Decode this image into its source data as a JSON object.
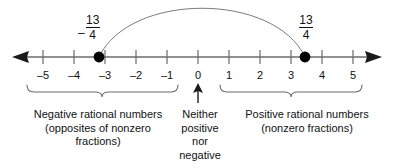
{
  "diagram": {
    "number_line": {
      "axis_label": "number-line-axis",
      "tick_values": [
        -5,
        -4,
        -3,
        -2,
        -1,
        0,
        1,
        2,
        3,
        4,
        5
      ],
      "tick_labels": [
        "–5",
        "–4",
        "–3",
        "–2",
        "–1",
        "0",
        "1",
        "2",
        "3",
        "4",
        "5"
      ],
      "min": -5,
      "max": 5,
      "arrow_left": true,
      "arrow_right": true,
      "line_color": "#6b6b6b"
    },
    "points": [
      {
        "name": "negative-point",
        "value": -3.25,
        "label_sign": "–",
        "label_numerator": "13",
        "label_denominator": "4",
        "color": "#000000"
      },
      {
        "name": "positive-point",
        "value": 3.25,
        "label_sign": "",
        "label_numerator": "13",
        "label_denominator": "4",
        "color": "#000000"
      }
    ],
    "connector_arc": {
      "name": "opposites-arc",
      "from": -3.25,
      "to": 3.25,
      "color": "#6b6b6b"
    },
    "zero_pointer": {
      "name": "zero-up-arrow",
      "points_to": "0"
    },
    "braces": [
      {
        "name": "negative-brace",
        "from": -5.5,
        "to": -0.6
      },
      {
        "name": "positive-brace",
        "from": 0.7,
        "to": 5.3
      }
    ],
    "captions": {
      "left": {
        "name": "negative-caption",
        "lines": [
          "Negative rational numbers",
          "(opposites of nonzero",
          "fractions)"
        ]
      },
      "middle": {
        "name": "zero-caption",
        "lines": [
          "Neither",
          "positive",
          "nor",
          "negative"
        ]
      },
      "right": {
        "name": "positive-caption",
        "lines": [
          "Positive rational numbers",
          "(nonzero fractions)"
        ]
      }
    }
  }
}
